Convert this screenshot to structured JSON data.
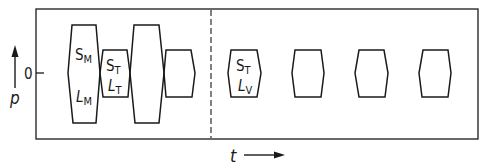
{
  "diagram": {
    "type": "pulse-sequence",
    "axes": {
      "y_label": "p",
      "y_zero_label": "0",
      "x_label": "t"
    },
    "colors": {
      "stroke": "#1a1a1a",
      "background": "#ffffff"
    },
    "pulses": [
      {
        "id": "pulse-1",
        "main": "S",
        "main_sub": "M",
        "second": "L",
        "second_sub": "M",
        "size": "large"
      },
      {
        "id": "pulse-2",
        "main": "S",
        "main_sub": "T",
        "second": "L",
        "second_sub": "T",
        "size": "small"
      },
      {
        "id": "pulse-3",
        "size": "large"
      },
      {
        "id": "pulse-4",
        "size": "small"
      },
      {
        "id": "pulse-5",
        "main": "S",
        "main_sub": "T",
        "second": "L",
        "second_sub": "V",
        "size": "small"
      },
      {
        "id": "pulse-6",
        "size": "small"
      },
      {
        "id": "pulse-7",
        "size": "small"
      },
      {
        "id": "pulse-8",
        "size": "small"
      }
    ],
    "separator": "dashed vertical line"
  }
}
